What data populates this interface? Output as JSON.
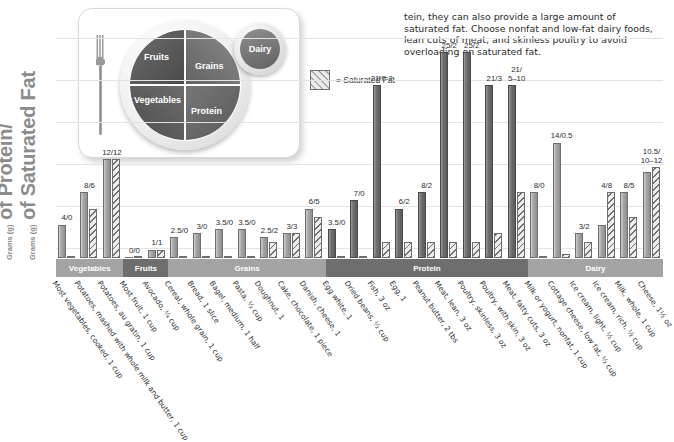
{
  "yaxis": {
    "line1_small": "Grams (g)",
    "line1_big": "of Protein/",
    "line2_small": "Grams (g)",
    "line2_big": "of Saturated Fat"
  },
  "illustration": {
    "name": "myplate-diagram",
    "fork_icon": "fork-icon",
    "segments": [
      {
        "name": "fruits",
        "label": "Fruits"
      },
      {
        "name": "grains",
        "label": "Grains"
      },
      {
        "name": "vegetables",
        "label": "Vegetables"
      },
      {
        "name": "protein",
        "label": "Protein"
      }
    ],
    "side_cup": {
      "name": "dairy",
      "label": "Dairy"
    }
  },
  "body_text": "tein, they can also provide a large amount of saturated fat. Choose nonfat and low-fat dairy foods, lean cuts of meat, and skinless poultry to avoid overloading on saturated fat.",
  "legend": {
    "swatch": "hatched-swatch",
    "label": "= Saturated Fat"
  },
  "colors": {
    "protein_bar_light": "#a6a6a6",
    "protein_bar_dark": "#6f6f6f",
    "fat_bar_hatch": "#e9e9e9",
    "band_light": "#a3a3a3",
    "band_dark": "#6e6e6e",
    "gridline": "#e3e3e3"
  },
  "chart_data": {
    "type": "bar",
    "title": "",
    "xlabel": "",
    "ylabel": "Grams (g) of Protein/Grams (g) of Saturated Fat",
    "ylim": [
      0,
      26
    ],
    "grid": true,
    "legend_position": "top-center",
    "series": [
      {
        "name": "Protein (g)",
        "key": "protein"
      },
      {
        "name": "Saturated Fat (g)",
        "key": "fat"
      }
    ],
    "groups": [
      {
        "band": "Vegetables",
        "band_shade": "light",
        "items": [
          {
            "label": "Most vegetables, cooked, 1 cup",
            "value_label": "4/0",
            "protein": 4,
            "fat": 0
          },
          {
            "label": "Potatoes, mashed with whole milk and butter, 1 cup",
            "value_label": "8/6",
            "protein": 8,
            "fat": 6
          },
          {
            "label": "Potatoes, au gratin, 1 cup",
            "value_label": "12/12",
            "protein": 12,
            "fat": 12
          }
        ]
      },
      {
        "band": "Fruits",
        "band_shade": "dark",
        "items": [
          {
            "label": "Most fruit, 1 cup",
            "value_label": "0/0",
            "protein": 0,
            "fat": 0
          },
          {
            "label": "Avocado, ¼ cup",
            "value_label": "1/1",
            "protein": 1,
            "fat": 1
          }
        ]
      },
      {
        "band": "Grains",
        "band_shade": "light",
        "items": [
          {
            "label": "Cereal, whole grain, 1 cup",
            "value_label": "2.5/0",
            "protein": 2.5,
            "fat": 0
          },
          {
            "label": "Bread, 1 slice",
            "value_label": "3/0",
            "protein": 3,
            "fat": 0
          },
          {
            "label": "Bagel, medium, 1 half",
            "value_label": "3.5/0",
            "protein": 3.5,
            "fat": 0
          },
          {
            "label": "Pasta, ½ cup",
            "value_label": "3.5/0",
            "protein": 3.5,
            "fat": 0
          },
          {
            "label": "Doughnut, 1",
            "value_label": "2.5/2",
            "protein": 2.5,
            "fat": 2
          },
          {
            "label": "Cake, chocolate, 1 piece",
            "value_label": "3/3",
            "protein": 3,
            "fat": 3
          },
          {
            "label": "Danish, cheese, 1",
            "value_label": "6/5",
            "protein": 6,
            "fat": 5
          }
        ]
      },
      {
        "band": "Protein",
        "band_shade": "dark",
        "items": [
          {
            "label": "Egg white, 1",
            "value_label": "3.5/0",
            "protein": 3.5,
            "fat": 0
          },
          {
            "label": "Dried beans, ½ cup",
            "value_label": "7/0",
            "protein": 7,
            "fat": 0
          },
          {
            "label": "Fish, 3 oz",
            "value_label": "21/0-2",
            "protein": 21,
            "fat": 2
          },
          {
            "label": "Egg, 1",
            "value_label": "6/2",
            "protein": 6,
            "fat": 2
          },
          {
            "label": "Peanut butter, 2 tbs",
            "value_label": "8/2",
            "protein": 8,
            "fat": 2
          },
          {
            "label": "Meat, lean, 3 oz",
            "value_label": "25/2",
            "protein": 25,
            "fat": 2
          },
          {
            "label": "Poultry, skinless, 3 oz",
            "value_label": "25/2",
            "protein": 25,
            "fat": 2
          },
          {
            "label": "Poultry, with skin, 3 oz",
            "value_label": "21/3",
            "protein": 21,
            "fat": 3
          },
          {
            "label": "Meat, fatty cuts, 3 oz",
            "value_label": "21/\n5–10",
            "protein": 21,
            "fat": 8
          }
        ]
      },
      {
        "band": "Dairy",
        "band_shade": "light",
        "items": [
          {
            "label": "Milk or yogurt, nonfat, 1 cup",
            "value_label": "8/0",
            "protein": 8,
            "fat": 0
          },
          {
            "label": "Cottage cheese, low fat, ½ cup",
            "value_label": "14/0.5",
            "protein": 14,
            "fat": 0.5
          },
          {
            "label": "Ice cream, light, ½ cup",
            "value_label": "3/2",
            "protein": 3,
            "fat": 2
          },
          {
            "label": "Ice cream, rich, ½ cup",
            "value_label": "4/8",
            "protein": 4,
            "fat": 8
          },
          {
            "label": "Milk, whole, 1 cup",
            "value_label": "8/5",
            "protein": 8,
            "fat": 5
          },
          {
            "label": "Cheese, 1½ oz",
            "value_label": "10.5/\n10–12",
            "protein": 10.5,
            "fat": 11
          }
        ]
      }
    ]
  }
}
